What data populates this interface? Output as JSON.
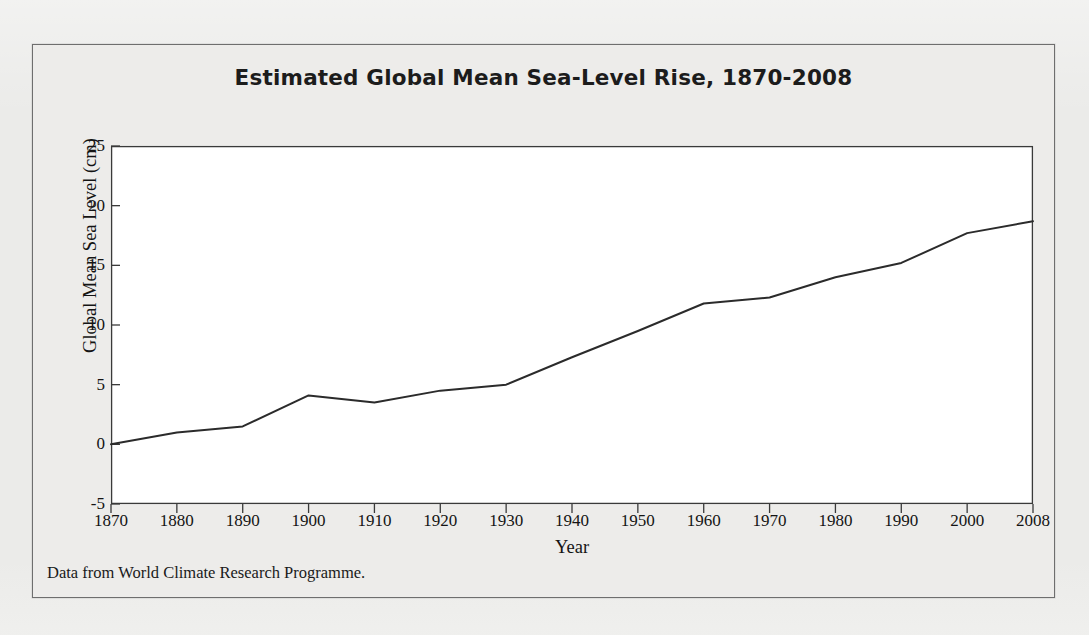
{
  "figure": {
    "caption": "Data from World Climate Research Programme.",
    "frame_color": "#6e6e6e",
    "background": "#ebebe9",
    "plot_background": "#ffffff"
  },
  "chart_data": {
    "type": "line",
    "title": "Estimated Global Mean Sea-Level Rise, 1870-2008",
    "xlabel": "Year",
    "ylabel": "Global Mean Sea Level (cm)",
    "xlim": [
      1870,
      2008
    ],
    "ylim": [
      -5,
      25
    ],
    "grid": false,
    "legend": "none",
    "line_color": "#2b2b2b",
    "line_width": 2.0,
    "x_tick_labels": [
      "1870",
      "1880",
      "1890",
      "1900",
      "1910",
      "1920",
      "1930",
      "1940",
      "1950",
      "1960",
      "1970",
      "1980",
      "1990",
      "2000",
      "2008"
    ],
    "x_ticks": [
      1870,
      1880,
      1890,
      1900,
      1910,
      1920,
      1930,
      1940,
      1950,
      1960,
      1970,
      1980,
      1990,
      2000,
      2008
    ],
    "y_tick_labels": [
      "-5",
      "0",
      "5",
      "10",
      "15",
      "20",
      "25"
    ],
    "y_ticks": [
      -5,
      0,
      5,
      10,
      15,
      20,
      25
    ],
    "x": [
      1870,
      1880,
      1890,
      1900,
      1910,
      1920,
      1930,
      1940,
      1950,
      1960,
      1970,
      1980,
      1990,
      2000,
      2008
    ],
    "values": [
      0.0,
      1.0,
      1.5,
      4.1,
      3.5,
      4.5,
      5.0,
      7.3,
      9.5,
      11.8,
      12.3,
      14.0,
      15.2,
      17.7,
      18.7
    ],
    "series": [
      {
        "name": "Global mean sea level",
        "values": [
          0.0,
          1.0,
          1.5,
          4.1,
          3.5,
          4.5,
          5.0,
          7.3,
          9.5,
          11.8,
          12.3,
          14.0,
          15.2,
          17.7,
          18.7
        ]
      }
    ]
  }
}
